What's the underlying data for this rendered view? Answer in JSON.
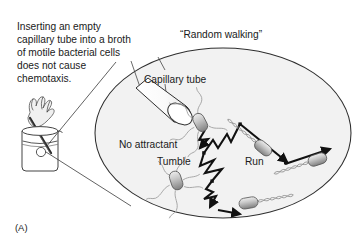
{
  "figure": {
    "panel_letter": "(A)",
    "caption": "Inserting an empty\ncapillary tube into a broth\nof motile bacterial cells\ndoes not cause\nchemotaxis.",
    "labels": {
      "random_walking": "“Random walking”",
      "capillary_tube": "Capillary tube",
      "no_attractant": "No attractant",
      "tumble": "Tumble",
      "run": "Run"
    },
    "colors": {
      "ink": "#1a1a1a",
      "stroke": "#333333",
      "magnifier_fill": "#f2f2f2",
      "cell_body_light": "#d9d9d9",
      "cell_body_dark": "#8c8c8c",
      "flagella": "#9a9a9a",
      "background": "#ffffff"
    },
    "magnifier": {
      "shape": "ellipse",
      "cx": 223,
      "cy": 133,
      "rx": 128,
      "ry": 85
    },
    "beaker": {
      "x": 22,
      "y": 128,
      "width": 36,
      "height": 42,
      "liquid_level_y": 143
    },
    "cells": [
      {
        "name": "tumbling-cell-upper",
        "state": "tumble",
        "x": 200,
        "y": 122,
        "angle": -28
      },
      {
        "name": "tumbling-cell-lower",
        "state": "tumble",
        "x": 176,
        "y": 180,
        "angle": -18
      },
      {
        "name": "running-cell-upper-right",
        "state": "run",
        "x": 262,
        "y": 147,
        "angle": 33
      },
      {
        "name": "running-cell-far-right",
        "state": "run",
        "x": 313,
        "y": 158,
        "angle": -14
      },
      {
        "name": "running-cell-bottom",
        "state": "run",
        "x": 248,
        "y": 203,
        "angle": 8
      }
    ],
    "random_walk_path": "zigzag trajectory of runs and tumbles"
  }
}
